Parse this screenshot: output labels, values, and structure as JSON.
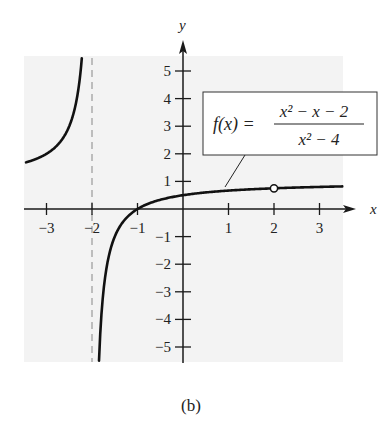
{
  "chart_data": {
    "type": "line",
    "title": "",
    "function": "f(x) = (x^2 - x - 2) / (x^2 - 4)",
    "label": {
      "lhs": "f(x) =",
      "numerator": "x² − x − 2",
      "denominator": "x² − 4"
    },
    "xlabel": "x",
    "ylabel": "y",
    "xlim": [
      -3.5,
      3.5
    ],
    "ylim": [
      -5.5,
      5.5
    ],
    "x_ticks": [
      -3,
      -2,
      -1,
      1,
      2,
      3
    ],
    "x_tick_labels": [
      "−3",
      "−2",
      "−1",
      "1",
      "2",
      "3"
    ],
    "y_ticks": [
      5,
      4,
      3,
      2,
      1,
      -1,
      -2,
      -3,
      -4,
      -5
    ],
    "y_tick_labels": [
      "5",
      "4",
      "3",
      "2",
      "1",
      "−1",
      "−2",
      "−3",
      "−4",
      "−5"
    ],
    "vertical_asymptote": {
      "x": -2,
      "style": "dashed"
    },
    "hole": {
      "x": 2,
      "y": 0.75,
      "style": "open-circle"
    },
    "branches": [
      {
        "name": "left-branch",
        "x_range": [
          -3.45,
          -2.224
        ],
        "points": [
          [
            -3.45,
            1.69
          ],
          [
            -3,
            2.0
          ],
          [
            -2.5,
            3.0
          ],
          [
            -2.3,
            4.33
          ],
          [
            -2.224,
            5.47
          ]
        ]
      },
      {
        "name": "right-branch",
        "x_range": [
          -1.846,
          3.5
        ],
        "points": [
          [
            -1.846,
            -5.5
          ],
          [
            -1.5,
            -1.0
          ],
          [
            -1,
            0
          ],
          [
            0,
            0.5
          ],
          [
            1,
            0.667
          ],
          [
            2,
            0.75
          ],
          [
            3,
            0.8
          ],
          [
            3.5,
            0.818
          ]
        ]
      }
    ],
    "grid": false,
    "legend": "boxed formula label with leader line to curve near x≈1"
  },
  "caption": "(b)",
  "colors": {
    "plot_background": "#f3f3f3",
    "curve": "#111111",
    "asymptote": "#9a9a9a",
    "axis": "#1a1a1a"
  }
}
